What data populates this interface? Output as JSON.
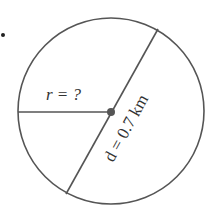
{
  "diagram": {
    "type": "circle-radius-diameter",
    "radius_label": "r = ?",
    "diameter_label": "d = 0.7 km",
    "colors": {
      "stroke": "#555555",
      "text": "#333333",
      "dot": "#555555"
    }
  }
}
